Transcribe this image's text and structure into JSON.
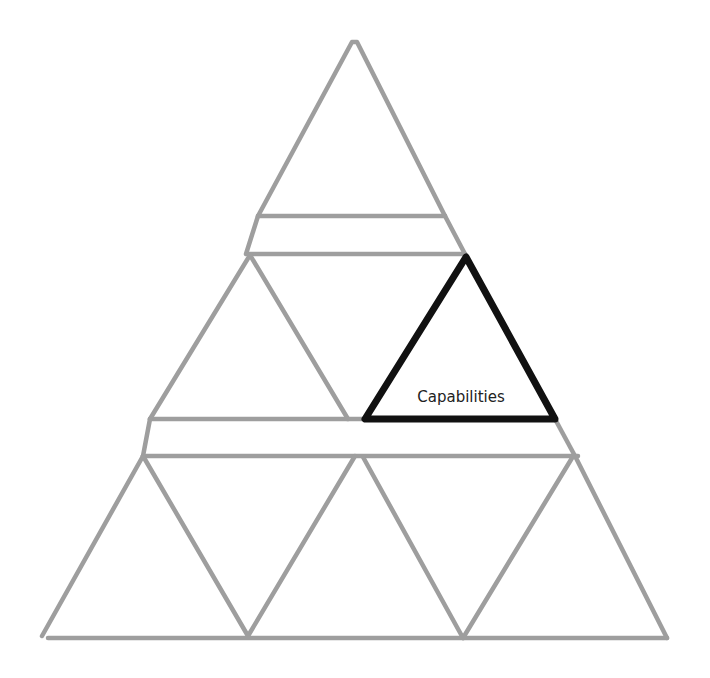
{
  "diagram": {
    "type": "triangular-pyramid-grid",
    "colors": {
      "background": "#ffffff",
      "grid_line": "#9e9e9e",
      "highlight": "#111111",
      "label": "#222222"
    },
    "highlighted_cell": {
      "label": "Capabilities",
      "row": "middle",
      "position": "right"
    },
    "rows": [
      {
        "name": "top",
        "cells": 1
      },
      {
        "name": "middle",
        "cells": 3
      },
      {
        "name": "bottom",
        "cells": 7
      }
    ]
  }
}
